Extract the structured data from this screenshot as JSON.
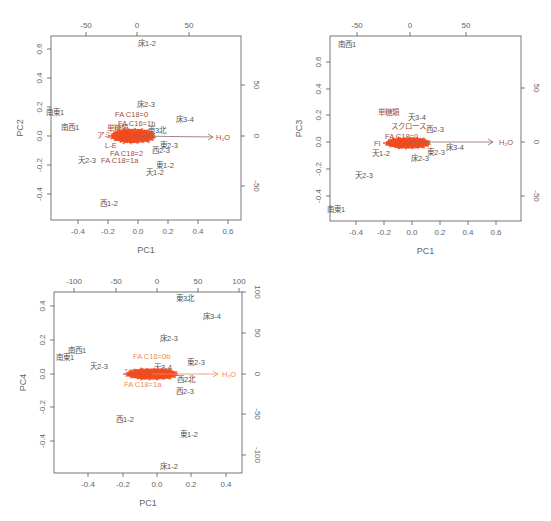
{
  "chart_data": [
    {
      "type": "scatter",
      "subtype": "biplot",
      "title": "",
      "xlabel": "PC1",
      "ylabel": "PC2",
      "x_ticks": [
        -0.4,
        -0.2,
        0.0,
        0.2,
        0.4,
        0.6
      ],
      "y_ticks": [
        -0.4,
        -0.2,
        0.0,
        0.2,
        0.4,
        0.6
      ],
      "top_ticks": [
        -50,
        0,
        50
      ],
      "right_ticks": [
        -50,
        0,
        50
      ],
      "xlim": [
        -0.58,
        0.68
      ],
      "ylim": [
        -0.58,
        0.68
      ],
      "observations": [
        {
          "label": "床1-2",
          "x": 0.03,
          "y": 0.64
        },
        {
          "label": "南東1",
          "x": -0.54,
          "y": 0.16
        },
        {
          "label": "南西1",
          "x": -0.43,
          "y": 0.06
        },
        {
          "label": "床2-3",
          "x": 0.06,
          "y": 0.22
        },
        {
          "label": "床3-4",
          "x": 0.33,
          "y": 0.12
        },
        {
          "label": "天2-3",
          "x": -0.34,
          "y": -0.17
        },
        {
          "label": "西1-2",
          "x": -0.19,
          "y": -0.46
        },
        {
          "label": "東2-3",
          "x": 0.19,
          "y": -0.07
        },
        {
          "label": "西2-3",
          "x": 0.15,
          "y": -0.1
        },
        {
          "label": "天1-2",
          "x": 0.12,
          "y": -0.24
        },
        {
          "label": "東1-2",
          "x": 0.15,
          "y": -0.2
        },
        {
          "label": "東3北",
          "x": 0.1,
          "y": 0.04
        }
      ],
      "variables": [
        {
          "label": "FA C18=0",
          "x": 0.0,
          "y": 0.16
        },
        {
          "label": "FA C16=1b",
          "x": 0.02,
          "y": 0.08
        },
        {
          "label": "L-E",
          "x": -0.14,
          "y": -0.06
        },
        {
          "label": "FA C18=2",
          "x": -0.06,
          "y": -0.12
        },
        {
          "label": "FA C18=1a",
          "x": -0.12,
          "y": -0.15
        },
        {
          "label": "単糖類",
          "x": -0.14,
          "y": 0.05
        },
        {
          "label": "アミノ酸",
          "x": -0.18,
          "y": 0.0
        },
        {
          "label": "H2O",
          "x": 0.51,
          "y": -0.01
        }
      ],
      "arrow": {
        "from": [
          0.0,
          0.0
        ],
        "to": [
          0.51,
          -0.01
        ],
        "label": "H2O"
      },
      "cluster_color": "#f04a1e"
    },
    {
      "type": "scatter",
      "subtype": "biplot",
      "title": "",
      "xlabel": "PC1",
      "ylabel": "PC3",
      "x_ticks": [
        -0.4,
        -0.2,
        0.0,
        0.2,
        0.4,
        0.6
      ],
      "y_ticks": [
        -0.4,
        -0.2,
        0.0,
        0.2,
        0.4,
        0.6
      ],
      "top_ticks": [
        -50,
        0,
        50
      ],
      "right_ticks": [
        -50,
        0,
        50
      ],
      "xlim": [
        -0.58,
        0.78
      ],
      "ylim": [
        -0.58,
        0.78
      ],
      "observations": [
        {
          "label": "南西1",
          "x": -0.44,
          "y": 0.73
        },
        {
          "label": "南東1",
          "x": -0.56,
          "y": -0.5
        },
        {
          "label": "天2-3",
          "x": -0.34,
          "y": -0.25
        },
        {
          "label": "天3-4",
          "x": -0.02,
          "y": 0.19
        },
        {
          "label": "西2-3",
          "x": 0.13,
          "y": 0.1
        },
        {
          "label": "床3-4",
          "x": 0.29,
          "y": -0.03
        },
        {
          "label": "床2-3",
          "x": 0.06,
          "y": -0.11
        },
        {
          "label": "東2-3",
          "x": 0.2,
          "y": -0.08
        },
        {
          "label": "天1-2",
          "x": -0.24,
          "y": -0.08
        }
      ],
      "variables": [
        {
          "label": "単糖類",
          "x": -0.13,
          "y": 0.22
        },
        {
          "label": "スクロース",
          "x": -0.08,
          "y": 0.12
        },
        {
          "label": "FA C18=0",
          "x": -0.03,
          "y": 0.04
        },
        {
          "label": "FA",
          "x": -0.24,
          "y": 0.0
        },
        {
          "label": "H2O",
          "x": 0.66,
          "y": 0.0
        }
      ],
      "arrow": {
        "from": [
          0.0,
          0.0
        ],
        "to": [
          0.6,
          0.0
        ],
        "label": "H2O"
      },
      "cluster_color": "#f04a1e"
    },
    {
      "type": "scatter",
      "subtype": "biplot",
      "title": "",
      "xlabel": "PC1",
      "ylabel": "PC4",
      "x_ticks": [
        -0.4,
        -0.2,
        0.0,
        0.2,
        0.4
      ],
      "y_ticks": [
        -0.4,
        -0.2,
        0.0,
        0.2,
        0.4
      ],
      "top_ticks": [
        -100,
        -50,
        0,
        50,
        100
      ],
      "right_ticks": [
        -100,
        -50,
        0,
        50,
        100
      ],
      "xlim": [
        -0.58,
        0.48
      ],
      "ylim": [
        -0.58,
        0.48
      ],
      "observations": [
        {
          "label": "東3北",
          "x": 0.16,
          "y": 0.44
        },
        {
          "label": "床3-4",
          "x": 0.31,
          "y": 0.33
        },
        {
          "label": "床2-3",
          "x": 0.06,
          "y": 0.21
        },
        {
          "label": "南西1",
          "x": -0.46,
          "y": 0.12
        },
        {
          "label": "南東1",
          "x": -0.53,
          "y": 0.09
        },
        {
          "label": "天2-3",
          "x": -0.33,
          "y": 0.04
        },
        {
          "label": "東2-3",
          "x": 0.22,
          "y": 0.06
        },
        {
          "label": "西2北",
          "x": 0.19,
          "y": -0.04
        },
        {
          "label": "西2-3",
          "x": 0.15,
          "y": -0.11
        },
        {
          "label": "西1-2",
          "x": -0.19,
          "y": -0.28
        },
        {
          "label": "東1-2",
          "x": 0.18,
          "y": -0.37
        },
        {
          "label": "床1-2",
          "x": 0.06,
          "y": -0.56
        },
        {
          "label": "天3-4",
          "x": 0.01,
          "y": 0.04
        }
      ],
      "variables": [
        {
          "label": "FA C16=0b",
          "x": -0.02,
          "y": 0.1
        },
        {
          "label": "FA C18=1a",
          "x": -0.05,
          "y": -0.07
        },
        {
          "label": "T",
          "x": -0.19,
          "y": 0.02
        },
        {
          "label": "H2O",
          "x": 0.41,
          "y": 0.0
        }
      ],
      "arrow": {
        "from": [
          0.0,
          0.0
        ],
        "to": [
          0.36,
          0.0
        ],
        "label": "H2O"
      },
      "cluster_color": "#f04a1e",
      "variable_color": "#f08a5a"
    }
  ],
  "panels": [
    {
      "id": "pc1-pc2",
      "box": {
        "x": 51,
        "y": 36,
        "w": 190,
        "h": 184
      },
      "xlabel": "PC1",
      "ylabel": "PC2",
      "x_ticks": [
        {
          "v": "-0.4",
          "px": 78
        },
        {
          "v": "-0.2",
          "px": 108
        },
        {
          "v": "0.0",
          "px": 138
        },
        {
          "v": "0.2",
          "px": 168
        },
        {
          "v": "0.4",
          "px": 198
        },
        {
          "v": "0.6",
          "px": 228
        }
      ],
      "y_ticks": [
        {
          "v": "0.6",
          "py": 49
        },
        {
          "v": "0.4",
          "py": 78
        },
        {
          "v": "0.2",
          "py": 107
        },
        {
          "v": "0.0",
          "py": 136
        },
        {
          "v": "-0.2",
          "py": 165
        },
        {
          "v": "-0.4",
          "py": 194
        }
      ],
      "top_ticks": [
        {
          "v": "-50",
          "px": 86
        },
        {
          "v": "0",
          "px": 137
        },
        {
          "v": "50",
          "px": 189
        }
      ],
      "right_ticks": [
        {
          "v": "50",
          "py": 85
        },
        {
          "v": "0",
          "py": 136
        },
        {
          "v": "-50",
          "py": 186
        }
      ],
      "cluster": {
        "cx": 133,
        "cy": 136,
        "rx": 26,
        "ry": 9
      },
      "arrow": {
        "x1": 133,
        "y1": 136,
        "x2": 213,
        "y2": 137,
        "label": "H2O",
        "lx": 216,
        "ly": 140
      },
      "labels": [
        {
          "t": "床1-2",
          "x": 138,
          "y": 46,
          "c": "obs"
        },
        {
          "t": "南東1",
          "x": 46,
          "y": 115,
          "c": "obs"
        },
        {
          "t": "南西1",
          "x": 61,
          "y": 130,
          "c": "obs"
        },
        {
          "t": "床2-3",
          "x": 137,
          "y": 107,
          "c": "obs"
        },
        {
          "t": "FA C18=0",
          "x": 115,
          "y": 117,
          "c": "var"
        },
        {
          "t": "FA C16=1b",
          "x": 118,
          "y": 126,
          "c": "var"
        },
        {
          "t": "床3-4",
          "x": 176,
          "y": 122,
          "c": "obs"
        },
        {
          "t": "東3北",
          "x": 148,
          "y": 133,
          "c": "obs"
        },
        {
          "t": "単糖類",
          "x": 107,
          "y": 131,
          "c": "var"
        },
        {
          "t": "アミノ",
          "x": 97,
          "y": 138,
          "c": "var"
        },
        {
          "t": "L-E",
          "x": 105,
          "y": 148,
          "c": "var"
        },
        {
          "t": "東2-3",
          "x": 160,
          "y": 148,
          "c": "obs"
        },
        {
          "t": "西2-3",
          "x": 152,
          "y": 153,
          "c": "obs"
        },
        {
          "t": "FA C18=2",
          "x": 110,
          "y": 156,
          "c": "var"
        },
        {
          "t": "天2-3",
          "x": 78,
          "y": 163,
          "c": "obs"
        },
        {
          "t": "FA C18=1a",
          "x": 101,
          "y": 163,
          "c": "var"
        },
        {
          "t": "東1-2",
          "x": 156,
          "y": 168,
          "c": "obs"
        },
        {
          "t": "天1-2",
          "x": 146,
          "y": 175,
          "c": "obs"
        },
        {
          "t": "西1-2",
          "x": 100,
          "y": 206,
          "c": "obs"
        }
      ]
    },
    {
      "id": "pc1-pc3",
      "box": {
        "x": 330,
        "y": 36,
        "w": 191,
        "h": 185
      },
      "xlabel": "PC1",
      "ylabel": "PC3",
      "x_ticks": [
        {
          "v": "-0.4",
          "px": 356
        },
        {
          "v": "-0.2",
          "px": 384
        },
        {
          "v": "0.0",
          "px": 412
        },
        {
          "v": "0.2",
          "px": 440
        },
        {
          "v": "0.4",
          "px": 468
        },
        {
          "v": "0.6",
          "px": 496
        }
      ],
      "y_ticks": [
        {
          "v": "0.6",
          "py": 62
        },
        {
          "v": "0.4",
          "py": 89
        },
        {
          "v": "0.2",
          "py": 115
        },
        {
          "v": "0.0",
          "py": 142
        },
        {
          "v": "-0.2",
          "py": 169
        },
        {
          "v": "-0.4",
          "py": 196
        }
      ],
      "top_ticks": [
        {
          "v": "-50",
          "px": 357
        },
        {
          "v": "0",
          "px": 410
        },
        {
          "v": "50",
          "px": 466
        }
      ],
      "right_ticks": [
        {
          "v": "50",
          "py": 88
        },
        {
          "v": "0",
          "py": 142
        },
        {
          "v": "-50",
          "py": 196
        }
      ],
      "cluster": {
        "cx": 408,
        "cy": 143,
        "rx": 26,
        "ry": 7
      },
      "arrow": {
        "x1": 408,
        "y1": 142,
        "x2": 493,
        "y2": 142,
        "label": "H2O",
        "lx": 499,
        "ly": 145
      },
      "labels": [
        {
          "t": "南西1",
          "x": 338,
          "y": 47,
          "c": "obs"
        },
        {
          "t": "単糖類",
          "x": 378,
          "y": 115,
          "c": "var"
        },
        {
          "t": "天3-4",
          "x": 408,
          "y": 120,
          "c": "obs"
        },
        {
          "t": "スクロース",
          "x": 391,
          "y": 129,
          "c": "var"
        },
        {
          "t": "西2-3",
          "x": 426,
          "y": 132,
          "c": "obs"
        },
        {
          "t": "FA C18=0",
          "x": 385,
          "y": 139,
          "c": "var"
        },
        {
          "t": "FI",
          "x": 374,
          "y": 146,
          "c": "var"
        },
        {
          "t": "床3-4",
          "x": 446,
          "y": 150,
          "c": "obs"
        },
        {
          "t": "東2-3",
          "x": 427,
          "y": 155,
          "c": "obs"
        },
        {
          "t": "天1-2",
          "x": 372,
          "y": 156,
          "c": "obs"
        },
        {
          "t": "床2-3",
          "x": 411,
          "y": 161,
          "c": "obs"
        },
        {
          "t": "天2-3",
          "x": 355,
          "y": 178,
          "c": "obs"
        },
        {
          "t": "南東1",
          "x": 327,
          "y": 212,
          "c": "obs"
        }
      ]
    },
    {
      "id": "pc1-pc4",
      "box": {
        "x": 54,
        "y": 292,
        "w": 188,
        "h": 181
      },
      "xlabel": "PC1",
      "ylabel": "PC4",
      "x_ticks": [
        {
          "v": "-0.4",
          "px": 88
        },
        {
          "v": "-0.2",
          "px": 123
        },
        {
          "v": "0.0",
          "px": 157
        },
        {
          "v": "0.2",
          "px": 191
        },
        {
          "v": "0.4",
          "px": 226
        }
      ],
      "y_ticks": [
        {
          "v": "0.4",
          "py": 306
        },
        {
          "v": "0.2",
          "py": 340
        },
        {
          "v": "0.0",
          "py": 374
        },
        {
          "v": "-0.2",
          "py": 407
        },
        {
          "v": "-0.4",
          "py": 441
        }
      ],
      "top_ticks": [
        {
          "v": "-100",
          "px": 74
        },
        {
          "v": "-50",
          "px": 116
        },
        {
          "v": "0",
          "px": 157
        },
        {
          "v": "50",
          "px": 198
        },
        {
          "v": "100",
          "px": 239
        }
      ],
      "right_ticks": [
        {
          "v": "100",
          "py": 292
        },
        {
          "v": "50",
          "py": 333
        },
        {
          "v": "0",
          "py": 374
        },
        {
          "v": "-50",
          "py": 414
        },
        {
          "v": "-100",
          "py": 455
        }
      ],
      "cluster": {
        "cx": 152,
        "cy": 374,
        "rx": 30,
        "ry": 7
      },
      "arrow": {
        "x1": 152,
        "y1": 374,
        "x2": 218,
        "y2": 374,
        "label": "H2O",
        "lx": 222,
        "ly": 377
      },
      "labels": [
        {
          "t": "東3北",
          "x": 176,
          "y": 301,
          "c": "obs"
        },
        {
          "t": "床3-4",
          "x": 203,
          "y": 319,
          "c": "obs"
        },
        {
          "t": "床2-3",
          "x": 160,
          "y": 341,
          "c": "obs"
        },
        {
          "t": "南西1",
          "x": 68,
          "y": 353,
          "c": "obs"
        },
        {
          "t": "南東1",
          "x": 56,
          "y": 360,
          "c": "obs"
        },
        {
          "t": "FA C16=0b",
          "x": 133,
          "y": 359,
          "c": "var3"
        },
        {
          "t": "東2-3",
          "x": 187,
          "y": 365,
          "c": "obs"
        },
        {
          "t": "天2-3",
          "x": 90,
          "y": 369,
          "c": "obs"
        },
        {
          "t": "天3-4",
          "x": 154,
          "y": 370,
          "c": "obs"
        },
        {
          "t": "TC",
          "x": 124,
          "y": 374,
          "c": "var3"
        },
        {
          "t": "西2北",
          "x": 177,
          "y": 382,
          "c": "obs"
        },
        {
          "t": "FA C18=1a",
          "x": 124,
          "y": 387,
          "c": "var3"
        },
        {
          "t": "西2-3",
          "x": 176,
          "y": 394,
          "c": "obs"
        },
        {
          "t": "西1-2",
          "x": 116,
          "y": 422,
          "c": "obs"
        },
        {
          "t": "東1-2",
          "x": 180,
          "y": 437,
          "c": "obs"
        },
        {
          "t": "床1-2",
          "x": 160,
          "y": 469,
          "c": "obs"
        }
      ]
    }
  ]
}
